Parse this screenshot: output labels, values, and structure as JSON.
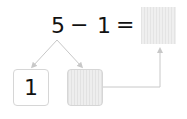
{
  "equation": {
    "operand1": "5",
    "operator": "−",
    "operand2": "1",
    "equals": "=",
    "result_box": "blank-shaded"
  },
  "decomposition": {
    "left_box": "1",
    "right_box": "blank-shaded"
  },
  "colors": {
    "line": "#c8c8c8",
    "box_border": "#d6d6d6",
    "shade": "#eeeeee",
    "text": "#111111"
  }
}
